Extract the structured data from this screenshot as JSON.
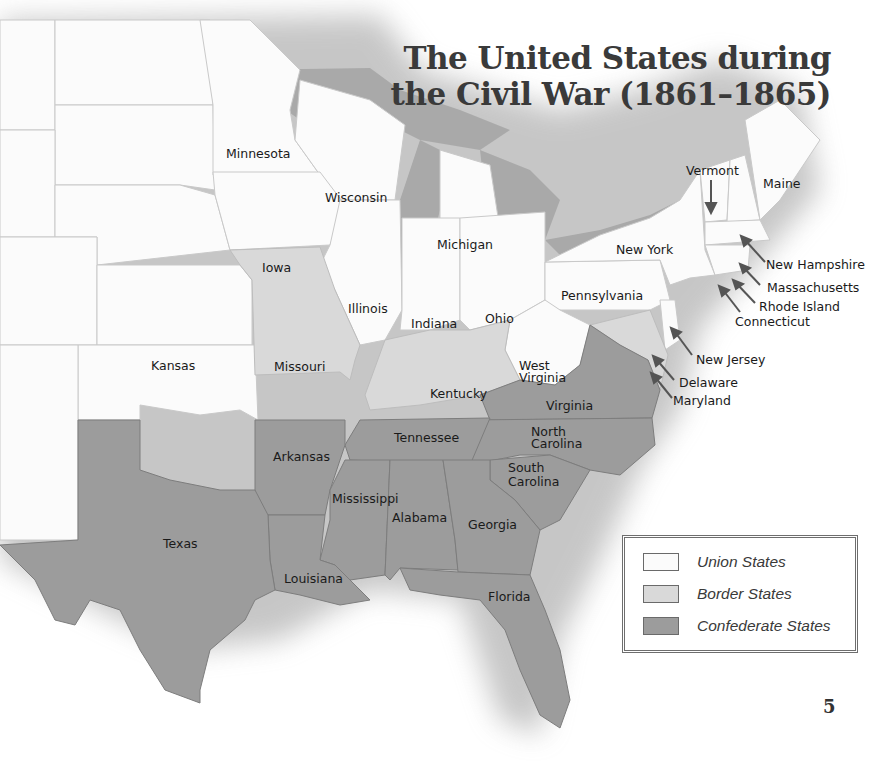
{
  "title": {
    "line1": "The United States during",
    "line2": "the Civil War (1861–1865)"
  },
  "colors": {
    "union": "#fbfbfb",
    "border": "#d9d9d9",
    "confederate": "#9c9c9c",
    "water": "#a9a9a9"
  },
  "states": {
    "minnesota": {
      "label": "Minnesota",
      "status": "union"
    },
    "wisconsin": {
      "label": "Wisconsin",
      "status": "union"
    },
    "michigan": {
      "label": "Michigan",
      "status": "union"
    },
    "iowa": {
      "label": "Iowa",
      "status": "union"
    },
    "illinois": {
      "label": "Illinois",
      "status": "union"
    },
    "indiana": {
      "label": "Indiana",
      "status": "union"
    },
    "ohio": {
      "label": "Ohio",
      "status": "union"
    },
    "new_york": {
      "label": "New York",
      "status": "union"
    },
    "pennsylvania": {
      "label": "Pennsylvania",
      "status": "union"
    },
    "kansas": {
      "label": "Kansas",
      "status": "union"
    },
    "west_virginia_l1": {
      "label": "West",
      "status": "union"
    },
    "west_virginia_l2": {
      "label": "Virginia",
      "status": "union"
    },
    "vermont": {
      "label": "Vermont",
      "status": "union"
    },
    "maine": {
      "label": "Maine",
      "status": "union"
    },
    "new_hampshire": {
      "label": "New Hampshire",
      "status": "union"
    },
    "massachusetts": {
      "label": "Massachusetts",
      "status": "union"
    },
    "rhode_island": {
      "label": "Rhode Island",
      "status": "union"
    },
    "connecticut": {
      "label": "Connecticut",
      "status": "union"
    },
    "new_jersey": {
      "label": "New Jersey",
      "status": "union"
    },
    "missouri": {
      "label": "Missouri",
      "status": "border"
    },
    "kentucky": {
      "label": "Kentucky",
      "status": "border"
    },
    "delaware": {
      "label": "Delaware",
      "status": "border"
    },
    "maryland": {
      "label": "Maryland",
      "status": "border"
    },
    "virginia": {
      "label": "Virginia",
      "status": "confederate"
    },
    "north_carolina_l1": {
      "label": "North",
      "status": "confederate"
    },
    "north_carolina_l2": {
      "label": "Carolina",
      "status": "confederate"
    },
    "south_carolina_l1": {
      "label": "South",
      "status": "confederate"
    },
    "south_carolina_l2": {
      "label": "Carolina",
      "status": "confederate"
    },
    "tennessee": {
      "label": "Tennessee",
      "status": "confederate"
    },
    "arkansas": {
      "label": "Arkansas",
      "status": "confederate"
    },
    "mississippi": {
      "label": "Mississippi",
      "status": "confederate"
    },
    "alabama": {
      "label": "Alabama",
      "status": "confederate"
    },
    "georgia": {
      "label": "Georgia",
      "status": "confederate"
    },
    "louisiana": {
      "label": "Louisiana",
      "status": "confederate"
    },
    "texas": {
      "label": "Texas",
      "status": "confederate"
    },
    "florida": {
      "label": "Florida",
      "status": "confederate"
    }
  },
  "legend": {
    "items": [
      {
        "label": "Union States",
        "color": "#fbfbfb"
      },
      {
        "label": "Border States",
        "color": "#d9d9d9"
      },
      {
        "label": "Confederate States",
        "color": "#9c9c9c"
      }
    ]
  },
  "page_number": "5"
}
